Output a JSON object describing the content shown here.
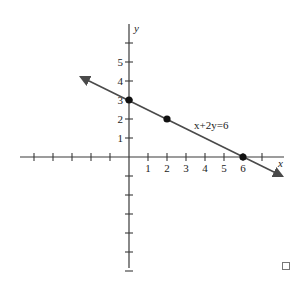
{
  "chart_data": {
    "type": "line",
    "title": "",
    "xlabel": "x",
    "ylabel": "y",
    "equation_label": "x+2y=6",
    "x_tick_labels": [
      "1",
      "2",
      "3",
      "4",
      "5",
      "6"
    ],
    "y_tick_labels": [
      "1",
      "2",
      "3",
      "4",
      "5"
    ],
    "xlim": [
      -6,
      8
    ],
    "ylim": [
      -7,
      7
    ],
    "grid": false,
    "series": [
      {
        "name": "x+2y=6",
        "x": [
          -2.5,
          7.5
        ],
        "y": [
          4.25,
          -0.75
        ]
      }
    ],
    "points": [
      {
        "x": 0,
        "y": 3
      },
      {
        "x": 2,
        "y": 2
      },
      {
        "x": 6,
        "y": 0
      }
    ],
    "colors": {
      "line": "#4a4a4a",
      "axes": "#3a3a3a",
      "points": "#111111"
    }
  }
}
